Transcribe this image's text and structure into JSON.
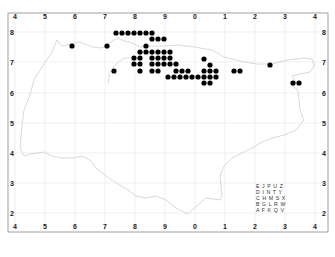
{
  "map": {
    "type": "distribution-map",
    "frame": {
      "left": 8,
      "top": 13,
      "right": 328,
      "bottom": 232
    },
    "grid": {
      "x_labels": [
        "4",
        "5",
        "6",
        "7",
        "8",
        "9",
        "0",
        "1",
        "2",
        "3",
        "4"
      ],
      "x_positions": [
        15,
        45,
        75,
        105,
        135,
        165,
        195,
        225,
        255,
        285,
        315
      ],
      "y_labels": [
        "8",
        "7",
        "6",
        "5",
        "4",
        "3",
        "2"
      ],
      "y_positions": [
        32,
        62,
        93,
        123,
        153,
        183,
        213
      ],
      "line_color": "#e6e6e6"
    },
    "outline_color": "#cfcfcf",
    "dot_color": "#000000",
    "dot_radius": 2.6,
    "dots": [
      [
        116,
        33
      ],
      [
        122,
        33
      ],
      [
        128,
        33
      ],
      [
        134,
        33
      ],
      [
        140,
        33
      ],
      [
        146,
        33
      ],
      [
        152,
        33
      ],
      [
        152,
        39
      ],
      [
        158,
        39
      ],
      [
        164,
        39
      ],
      [
        72,
        46
      ],
      [
        107,
        46
      ],
      [
        146,
        46
      ],
      [
        140,
        52
      ],
      [
        146,
        52
      ],
      [
        152,
        52
      ],
      [
        158,
        52
      ],
      [
        164,
        52
      ],
      [
        170,
        52
      ],
      [
        134,
        58
      ],
      [
        140,
        58
      ],
      [
        152,
        58
      ],
      [
        158,
        58
      ],
      [
        164,
        58
      ],
      [
        170,
        58
      ],
      [
        134,
        64
      ],
      [
        140,
        64
      ],
      [
        152,
        64
      ],
      [
        158,
        64
      ],
      [
        164,
        64
      ],
      [
        170,
        64
      ],
      [
        176,
        64
      ],
      [
        114,
        71
      ],
      [
        140,
        71
      ],
      [
        152,
        71
      ],
      [
        158,
        71
      ],
      [
        176,
        71
      ],
      [
        182,
        71
      ],
      [
        188,
        71
      ],
      [
        204,
        71
      ],
      [
        210,
        71
      ],
      [
        216,
        71
      ],
      [
        168,
        77
      ],
      [
        174,
        77
      ],
      [
        180,
        77
      ],
      [
        186,
        77
      ],
      [
        192,
        77
      ],
      [
        198,
        77
      ],
      [
        204,
        77
      ],
      [
        210,
        77
      ],
      [
        216,
        77
      ],
      [
        204,
        83
      ],
      [
        210,
        83
      ],
      [
        204,
        59
      ],
      [
        210,
        65
      ],
      [
        234,
        71
      ],
      [
        240,
        71
      ],
      [
        270,
        65
      ],
      [
        293,
        83
      ],
      [
        299,
        83
      ]
    ],
    "key": {
      "rows": [
        "E J P U Z",
        "D I N T Y",
        "C H M S X",
        "B G L R W",
        "A F K Q V"
      ],
      "x": 256,
      "y_start": 188,
      "line_height": 6
    }
  }
}
